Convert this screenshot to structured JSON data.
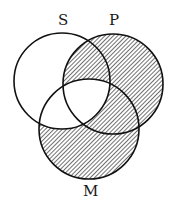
{
  "diagram": {
    "type": "venn",
    "circles": [
      {
        "id": "S",
        "label": "S",
        "cx": 62,
        "cy": 81,
        "r": 48
      },
      {
        "id": "P",
        "label": "P",
        "cx": 113,
        "cy": 84,
        "r": 50
      },
      {
        "id": "M",
        "label": "M",
        "cx": 89,
        "cy": 129,
        "r": 50
      }
    ],
    "shaded_regions": [
      "S∩P only",
      "P only",
      "P∩M only",
      "M only"
    ],
    "unshaded_regions": [
      "S only",
      "S∩M only",
      "S∩P∩M"
    ],
    "colors": {
      "stroke": "#111111",
      "hatch": "#333333",
      "background": "#ffffff"
    }
  }
}
